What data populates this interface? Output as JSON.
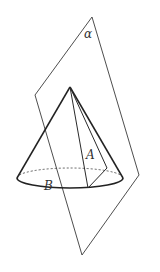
{
  "figure": {
    "colors": {
      "stroke": "#2a2a2a",
      "background": "#ffffff"
    },
    "labels": {
      "plane": "α",
      "point_a": "A",
      "point_b": "B"
    },
    "plane_vertices": [
      [
        92,
        17
      ],
      [
        35,
        95
      ],
      [
        82,
        255
      ],
      [
        139,
        175
      ]
    ],
    "cone": {
      "apex": [
        70,
        87
      ],
      "base_center": [
        70,
        178
      ],
      "base_rx": 53,
      "base_ry": 10
    }
  }
}
